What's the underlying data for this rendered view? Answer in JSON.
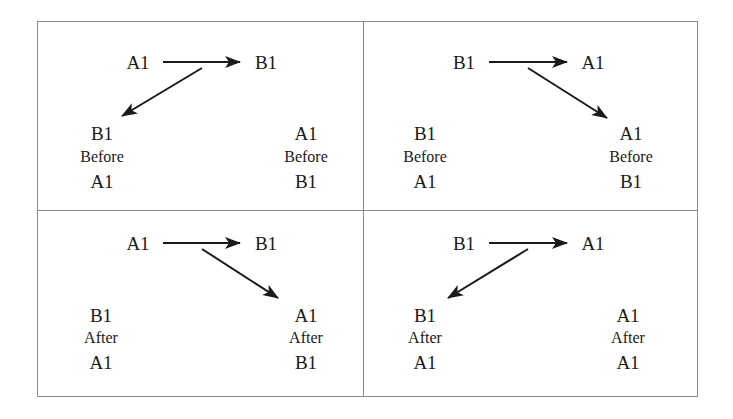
{
  "diagram": {
    "type": "2x2 grid of ordering relations",
    "colors": {
      "border": "#8a8a8a",
      "ink": "#1a1a1a",
      "background": "#ffffff"
    },
    "quadrants": [
      {
        "id": "top-left",
        "top_row": {
          "left": "A1",
          "right": "B1"
        },
        "diagonal": "from arrow midpoint down-left to left stack",
        "left_stack": {
          "top": "B1",
          "middle": "Before",
          "bottom": "A1"
        },
        "right_stack": {
          "top": "A1",
          "middle": "Before",
          "bottom": "B1"
        }
      },
      {
        "id": "top-right",
        "top_row": {
          "left": "B1",
          "right": "A1"
        },
        "diagonal": "from arrow midpoint down-right to right stack",
        "left_stack": {
          "top": "B1",
          "middle": "Before",
          "bottom": "A1"
        },
        "right_stack": {
          "top": "A1",
          "middle": "Before",
          "bottom": "B1"
        }
      },
      {
        "id": "bottom-left",
        "top_row": {
          "left": "A1",
          "right": "B1"
        },
        "diagonal": "from arrow midpoint down-right to right stack",
        "left_stack": {
          "top": "B1",
          "middle": "After",
          "bottom": "A1"
        },
        "right_stack": {
          "top": "A1",
          "middle": "After",
          "bottom": "B1"
        }
      },
      {
        "id": "bottom-right",
        "top_row": {
          "left": "B1",
          "right": "A1"
        },
        "diagonal": "from arrow midpoint down-left to left stack",
        "left_stack": {
          "top": "B1",
          "middle": "After",
          "bottom": "A1"
        },
        "right_stack": {
          "top": "A1",
          "middle": "After",
          "bottom": "A1"
        }
      }
    ]
  }
}
